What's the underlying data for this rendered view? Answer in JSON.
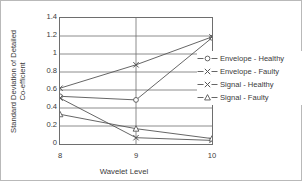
{
  "chart_data": {
    "type": "line",
    "title": "",
    "xlabel": "Wavelet Level",
    "ylabel_line1": "Standard Deviation of Detailed",
    "ylabel_line2": "Co-efficient",
    "categories": [
      8,
      9,
      10
    ],
    "x_tick_labels": [
      "8",
      "9",
      "10"
    ],
    "y_tick_labels": [
      "1.4",
      "1.2",
      "1",
      "0.8",
      "0.6",
      "0.4",
      "0.2",
      "0"
    ],
    "y_tick_values": [
      1.4,
      1.2,
      1.0,
      0.8,
      0.6,
      0.4,
      0.2,
      0
    ],
    "ylim": [
      0,
      1.4
    ],
    "xlim": [
      8,
      10
    ],
    "grid": true,
    "grid_axis": "both",
    "legend_position": "right-inside",
    "series": [
      {
        "name": "Envelope - Healthy",
        "marker": "circle",
        "color": "#555555",
        "values": [
          0.53,
          0.49,
          1.18
        ]
      },
      {
        "name": "Envelope - Faulty",
        "marker": "x",
        "color": "#555555",
        "values": [
          0.62,
          0.88,
          1.19
        ]
      },
      {
        "name": "Signal - Healthy",
        "marker": "x",
        "color": "#555555",
        "values": [
          0.51,
          0.07,
          0.04
        ]
      },
      {
        "name": "Signal - Faulty",
        "marker": "triangle",
        "color": "#555555",
        "values": [
          0.33,
          0.17,
          0.06
        ]
      }
    ]
  },
  "legend": {
    "items": [
      {
        "label": "Envelope - Healthy",
        "marker": "circle-marker-icon"
      },
      {
        "label": "Envelope - Faulty",
        "marker": "x-marker-icon"
      },
      {
        "label": "Signal - Healthy",
        "marker": "x-marker-icon"
      },
      {
        "label": "Signal - Faulty",
        "marker": "triangle-marker-icon"
      }
    ]
  }
}
